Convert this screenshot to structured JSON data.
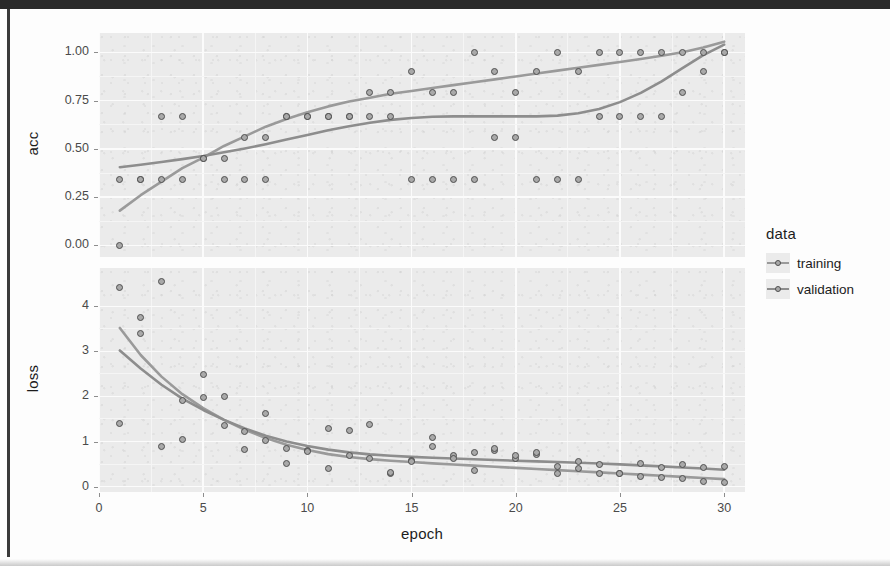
{
  "figure": {
    "x_axis_title": "epoch",
    "panels": [
      {
        "key": "acc",
        "y_axis_title": "acc",
        "y_ticks": [
          "0.00",
          "0.25",
          "0.50",
          "0.75",
          "1.00"
        ]
      },
      {
        "key": "loss",
        "y_axis_title": "loss",
        "y_ticks": [
          "0",
          "1",
          "2",
          "3",
          "4"
        ]
      }
    ],
    "x_ticks": [
      "0",
      "5",
      "10",
      "15",
      "20",
      "25",
      "30"
    ]
  },
  "legend": {
    "title": "data",
    "items": [
      {
        "label": "training",
        "color": "#9a9a9a"
      },
      {
        "label": "validation",
        "color": "#8d8d8d"
      }
    ]
  },
  "colors": {
    "panel_background": "#ebebeb",
    "grid_major": "#fbfbfb",
    "grid_minor": "#f5f5f5",
    "point_fill": "#a9a9a9",
    "point_stroke": "#4f4f4f",
    "training_line": "#9a9a9a",
    "validation_line": "#8d8d8d",
    "text": "#1c1c1c",
    "tick_text": "#4a4a4a"
  },
  "chart_data": {
    "type": "scatter",
    "title": "",
    "xlabel": "epoch",
    "ylabel": "",
    "xlim": [
      0,
      31
    ],
    "grid": true,
    "legend_position": "right",
    "facets": [
      {
        "name": "acc",
        "ylabel": "acc",
        "ylim": [
          -0.06,
          1.1
        ],
        "yticks": [
          0.0,
          0.25,
          0.5,
          0.75,
          1.0
        ],
        "series": [
          {
            "name": "training",
            "x": [
              1,
              2,
              3,
              4,
              5,
              6,
              7,
              8,
              9,
              10,
              11,
              12,
              13,
              14,
              15,
              16,
              17,
              18,
              19,
              20,
              21,
              22,
              23,
              24,
              25,
              26,
              27,
              28,
              29,
              30
            ],
            "y": [
              0.0,
              0.34,
              0.34,
              0.34,
              0.45,
              0.45,
              0.56,
              0.56,
              0.67,
              0.67,
              0.67,
              0.67,
              0.79,
              0.79,
              0.9,
              0.79,
              0.79,
              1.0,
              0.9,
              0.79,
              0.9,
              1.0,
              0.9,
              1.0,
              1.0,
              1.0,
              1.0,
              1.0,
              1.0,
              1.0
            ],
            "smooth": [
              [
                1,
                0.18
              ],
              [
                2,
                0.26
              ],
              [
                3,
                0.33
              ],
              [
                4,
                0.4
              ],
              [
                5,
                0.455
              ],
              [
                6,
                0.515
              ],
              [
                7,
                0.565
              ],
              [
                8,
                0.615
              ],
              [
                9,
                0.655
              ],
              [
                10,
                0.69
              ],
              [
                11,
                0.72
              ],
              [
                12,
                0.745
              ],
              [
                13,
                0.765
              ],
              [
                14,
                0.785
              ],
              [
                15,
                0.8
              ],
              [
                16,
                0.815
              ],
              [
                17,
                0.83
              ],
              [
                18,
                0.845
              ],
              [
                19,
                0.86
              ],
              [
                20,
                0.875
              ],
              [
                21,
                0.89
              ],
              [
                22,
                0.905
              ],
              [
                23,
                0.92
              ],
              [
                24,
                0.935
              ],
              [
                25,
                0.95
              ],
              [
                26,
                0.965
              ],
              [
                27,
                0.982
              ],
              [
                28,
                1.0
              ],
              [
                29,
                1.025
              ],
              [
                30,
                1.055
              ]
            ]
          },
          {
            "name": "validation",
            "x": [
              1,
              2,
              3,
              4,
              5,
              6,
              7,
              8,
              9,
              10,
              11,
              12,
              13,
              14,
              15,
              16,
              17,
              18,
              19,
              20,
              21,
              22,
              23,
              24,
              25,
              26,
              27,
              28,
              29,
              30
            ],
            "y": [
              0.34,
              0.34,
              0.67,
              0.67,
              0.45,
              0.34,
              0.34,
              0.34,
              0.67,
              0.67,
              0.67,
              0.67,
              0.67,
              0.67,
              0.34,
              0.34,
              0.34,
              0.34,
              0.56,
              0.56,
              0.34,
              0.34,
              0.34,
              0.67,
              0.67,
              0.67,
              0.67,
              0.79,
              0.9,
              1.0
            ],
            "smooth": [
              [
                1,
                0.405
              ],
              [
                2,
                0.418
              ],
              [
                3,
                0.432
              ],
              [
                4,
                0.447
              ],
              [
                5,
                0.463
              ],
              [
                6,
                0.482
              ],
              [
                7,
                0.502
              ],
              [
                8,
                0.524
              ],
              [
                9,
                0.548
              ],
              [
                10,
                0.572
              ],
              [
                11,
                0.596
              ],
              [
                12,
                0.617
              ],
              [
                13,
                0.635
              ],
              [
                14,
                0.65
              ],
              [
                15,
                0.66
              ],
              [
                16,
                0.666
              ],
              [
                17,
                0.668
              ],
              [
                18,
                0.668
              ],
              [
                19,
                0.668
              ],
              [
                20,
                0.668
              ],
              [
                21,
                0.668
              ],
              [
                22,
                0.672
              ],
              [
                23,
                0.684
              ],
              [
                24,
                0.706
              ],
              [
                25,
                0.742
              ],
              [
                26,
                0.79
              ],
              [
                27,
                0.85
              ],
              [
                28,
                0.918
              ],
              [
                29,
                0.985
              ],
              [
                30,
                1.04
              ]
            ]
          }
        ]
      },
      {
        "name": "loss",
        "ylabel": "loss",
        "ylim": [
          -0.12,
          4.85
        ],
        "yticks": [
          0,
          1,
          2,
          3,
          4
        ],
        "series": [
          {
            "name": "training",
            "x": [
              1,
              2,
              3,
              4,
              5,
              6,
              7,
              8,
              9,
              10,
              11,
              12,
              13,
              14,
              15,
              16,
              17,
              18,
              19,
              20,
              21,
              22,
              23,
              24,
              25,
              26,
              27,
              28,
              29,
              30
            ],
            "y": [
              4.42,
              3.76,
              4.55,
              1.92,
              2.48,
              2.0,
              1.22,
              1.62,
              0.85,
              0.8,
              0.4,
              0.68,
              0.62,
              0.3,
              0.58,
              0.88,
              0.68,
              0.75,
              0.8,
              0.62,
              0.72,
              0.45,
              0.4,
              0.3,
              0.28,
              0.22,
              0.2,
              0.18,
              0.12,
              0.08
            ],
            "smooth": [
              [
                1,
                3.52
              ],
              [
                2,
                2.92
              ],
              [
                3,
                2.44
              ],
              [
                4,
                2.05
              ],
              [
                5,
                1.74
              ],
              [
                6,
                1.48
              ],
              [
                7,
                1.26
              ],
              [
                8,
                1.08
              ],
              [
                9,
                0.93
              ],
              [
                10,
                0.81
              ],
              [
                11,
                0.72
              ],
              [
                12,
                0.655
              ],
              [
                13,
                0.61
              ],
              [
                14,
                0.575
              ],
              [
                15,
                0.545
              ],
              [
                16,
                0.515
              ],
              [
                17,
                0.49
              ],
              [
                18,
                0.465
              ],
              [
                19,
                0.44
              ],
              [
                20,
                0.415
              ],
              [
                21,
                0.39
              ],
              [
                22,
                0.365
              ],
              [
                23,
                0.34
              ],
              [
                24,
                0.315
              ],
              [
                25,
                0.29
              ],
              [
                26,
                0.265
              ],
              [
                27,
                0.24
              ],
              [
                28,
                0.215
              ],
              [
                29,
                0.19
              ],
              [
                30,
                0.165
              ]
            ]
          },
          {
            "name": "validation",
            "x": [
              1,
              2,
              3,
              4,
              5,
              6,
              7,
              8,
              9,
              10,
              11,
              12,
              13,
              14,
              15,
              16,
              17,
              18,
              19,
              20,
              21,
              22,
              23,
              24,
              25,
              26,
              27,
              28,
              29,
              30
            ],
            "y": [
              1.4,
              3.4,
              0.88,
              1.05,
              1.98,
              1.35,
              0.82,
              1.02,
              0.52,
              0.78,
              1.3,
              1.24,
              1.38,
              0.32,
              0.55,
              1.1,
              0.62,
              0.35,
              0.85,
              0.7,
              0.75,
              0.3,
              0.55,
              0.48,
              0.3,
              0.52,
              0.42,
              0.48,
              0.42,
              0.45
            ],
            "smooth": [
              [
                1,
                3.02
              ],
              [
                2,
                2.62
              ],
              [
                3,
                2.26
              ],
              [
                4,
                1.95
              ],
              [
                5,
                1.7
              ],
              [
                6,
                1.48
              ],
              [
                7,
                1.29
              ],
              [
                8,
                1.13
              ],
              [
                9,
                1.0
              ],
              [
                10,
                0.9
              ],
              [
                11,
                0.82
              ],
              [
                12,
                0.76
              ],
              [
                13,
                0.715
              ],
              [
                14,
                0.685
              ],
              [
                15,
                0.66
              ],
              [
                16,
                0.64
              ],
              [
                17,
                0.622
              ],
              [
                18,
                0.606
              ],
              [
                19,
                0.59
              ],
              [
                20,
                0.575
              ],
              [
                21,
                0.56
              ],
              [
                22,
                0.545
              ],
              [
                23,
                0.53
              ],
              [
                24,
                0.512
              ],
              [
                25,
                0.492
              ],
              [
                26,
                0.47
              ],
              [
                27,
                0.448
              ],
              [
                28,
                0.425
              ],
              [
                29,
                0.4
              ],
              [
                30,
                0.375
              ]
            ]
          }
        ]
      }
    ]
  }
}
